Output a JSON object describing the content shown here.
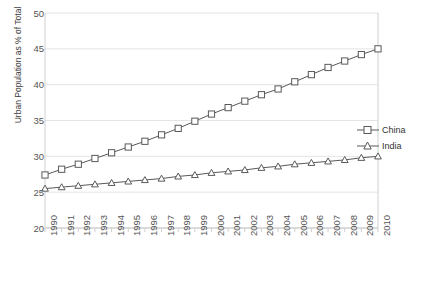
{
  "chart_data": {
    "type": "line",
    "title": "",
    "xlabel": "",
    "ylabel": "Urban Population as % of Total",
    "ylim": [
      20,
      50
    ],
    "ytick_values": [
      20,
      25,
      30,
      35,
      40,
      45,
      50
    ],
    "grid": true,
    "legend_position": "right",
    "categories": [
      "1990",
      "1991",
      "1992",
      "1993",
      "1994",
      "1995",
      "1996",
      "1997",
      "1998",
      "1999",
      "2000",
      "2001",
      "2002",
      "2003",
      "2004",
      "2005",
      "2006",
      "2007",
      "2008",
      "2009",
      "2010"
    ],
    "series": [
      {
        "name": "China",
        "marker": "open-square",
        "color": "#595959",
        "values": [
          27.4,
          28.2,
          28.9,
          29.7,
          30.5,
          31.3,
          32.1,
          33.0,
          33.9,
          34.9,
          35.9,
          36.8,
          37.7,
          38.6,
          39.4,
          40.4,
          41.4,
          42.4,
          43.3,
          44.2,
          45.0
        ]
      },
      {
        "name": "India",
        "marker": "open-triangle",
        "color": "#595959",
        "values": [
          25.5,
          25.7,
          25.9,
          26.1,
          26.3,
          26.5,
          26.7,
          26.9,
          27.2,
          27.4,
          27.7,
          27.9,
          28.1,
          28.4,
          28.6,
          28.9,
          29.1,
          29.3,
          29.5,
          29.8,
          30.0
        ]
      }
    ]
  },
  "legend": {
    "items": [
      {
        "label": "China"
      },
      {
        "label": "India"
      }
    ]
  },
  "axes": {
    "y_title": "Urban Population as % of Total",
    "y_ticks": [
      "20",
      "25",
      "30",
      "35",
      "40",
      "45",
      "50"
    ],
    "x_ticks": [
      "1990",
      "1991",
      "1992",
      "1993",
      "1994",
      "1995",
      "1996",
      "1997",
      "1998",
      "1999",
      "2000",
      "2001",
      "2002",
      "2003",
      "2004",
      "2005",
      "2006",
      "2007",
      "2008",
      "2009",
      "2010"
    ]
  },
  "colors": {
    "line": "#595959",
    "grid": "#e4e4e4",
    "frame": "#d0d0d0",
    "text": "#555555"
  }
}
